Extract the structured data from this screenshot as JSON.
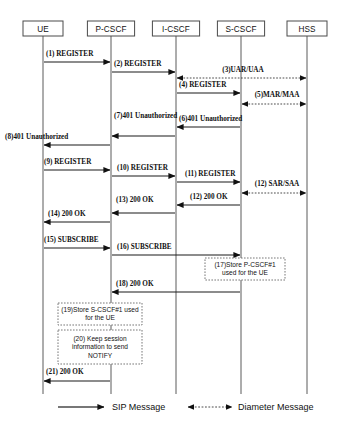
{
  "diagram": {
    "type": "sequence-diagram",
    "actors": [
      {
        "id": "ue",
        "label": "UE",
        "x": 43
      },
      {
        "id": "pcscf",
        "label": "P-CSCF",
        "x": 111
      },
      {
        "id": "icscf",
        "label": "I-CSCF",
        "x": 176
      },
      {
        "id": "scscf",
        "label": "S-CSCF",
        "x": 241
      },
      {
        "id": "hss",
        "label": "HSS",
        "x": 307
      }
    ],
    "messages": [
      {
        "n": 1,
        "label": "(1) REGISTER",
        "from": "ue",
        "to": "pcscf",
        "kind": "sip",
        "dir": "right",
        "y": 62,
        "labelAnchor": "start",
        "labelX": 46,
        "labelY": 56
      },
      {
        "n": 2,
        "label": "(2) REGISTER",
        "from": "pcscf",
        "to": "icscf",
        "kind": "sip",
        "dir": "right",
        "y": 72,
        "labelAnchor": "start",
        "labelX": 114,
        "labelY": 66
      },
      {
        "n": 3,
        "label": "(3)UAR/UAA",
        "from": "icscf",
        "to": "hss",
        "kind": "diameter",
        "dir": "both",
        "y": 78,
        "labelAnchor": "middle",
        "labelX": 243,
        "labelY": 72
      },
      {
        "n": 4,
        "label": "(4) REGISTER",
        "from": "icscf",
        "to": "scscf",
        "kind": "sip",
        "dir": "right",
        "y": 93,
        "labelAnchor": "start",
        "labelX": 179,
        "labelY": 87
      },
      {
        "n": 5,
        "label": "(5)MAR/MAA",
        "from": "scscf",
        "to": "hss",
        "kind": "diameter",
        "dir": "both",
        "y": 104,
        "labelAnchor": "middle",
        "labelX": 277,
        "labelY": 97
      },
      {
        "n": 6,
        "label": "(6)401 Unauthorized",
        "from": "scscf",
        "to": "icscf",
        "kind": "sip",
        "dir": "left",
        "y": 127,
        "labelAnchor": "start",
        "labelX": 179,
        "labelY": 121
      },
      {
        "n": 7,
        "label": "(7)401 Unauthorized",
        "from": "icscf",
        "to": "pcscf",
        "kind": "sip",
        "dir": "left",
        "y": 136,
        "labelAnchor": "start",
        "labelX": 114,
        "labelY": 118
      },
      {
        "n": 8,
        "label": "(8)401 Unauthorized",
        "from": "pcscf",
        "to": "ue",
        "kind": "sip",
        "dir": "left",
        "y": 145,
        "labelAnchor": "start",
        "labelX": 5,
        "labelY": 139
      },
      {
        "n": 9,
        "label": "(9) REGISTER",
        "from": "ue",
        "to": "pcscf",
        "kind": "sip",
        "dir": "right",
        "y": 170,
        "labelAnchor": "start",
        "labelX": 44,
        "labelY": 164
      },
      {
        "n": 10,
        "label": "(10) REGISTER",
        "from": "pcscf",
        "to": "icscf",
        "kind": "sip",
        "dir": "right",
        "y": 176,
        "labelAnchor": "start",
        "labelX": 117,
        "labelY": 170
      },
      {
        "n": 11,
        "label": "(11) REGISTER",
        "from": "icscf",
        "to": "scscf",
        "kind": "sip",
        "dir": "right",
        "y": 182,
        "labelAnchor": "start",
        "labelX": 185,
        "labelY": 176
      },
      {
        "n": 12,
        "label": "(12) SAR/SAA",
        "from": "scscf",
        "to": "hss",
        "kind": "diameter",
        "dir": "both",
        "y": 193,
        "labelAnchor": "middle",
        "labelX": 277,
        "labelY": 186
      },
      {
        "n": 13,
        "label": "(12) 200 OK",
        "from": "scscf",
        "to": "icscf",
        "kind": "sip",
        "dir": "left",
        "y": 205,
        "labelAnchor": "start",
        "labelX": 190,
        "labelY": 199
      },
      {
        "n": 14,
        "label": "(13) 200 OK",
        "from": "icscf",
        "to": "pcscf",
        "kind": "sip",
        "dir": "left",
        "y": 213,
        "labelAnchor": "start",
        "labelX": 116,
        "labelY": 202
      },
      {
        "n": 15,
        "label": "(14) 200 OK",
        "from": "pcscf",
        "to": "ue",
        "kind": "sip",
        "dir": "left",
        "y": 222,
        "labelAnchor": "start",
        "labelX": 48,
        "labelY": 216
      },
      {
        "n": 16,
        "label": "(15) SUBSCRIBE",
        "from": "ue",
        "to": "pcscf",
        "kind": "sip",
        "dir": "right",
        "y": 248,
        "labelAnchor": "start",
        "labelX": 44,
        "labelY": 242
      },
      {
        "n": 17,
        "label": "(16) SUBSCRIBE",
        "from": "pcscf",
        "to": "scscf",
        "kind": "sip",
        "dir": "right",
        "y": 255,
        "labelAnchor": "start",
        "labelX": 117,
        "labelY": 249
      },
      {
        "n": 18,
        "label": "(18) 200 OK",
        "from": "scscf",
        "to": "pcscf",
        "kind": "sip",
        "dir": "left",
        "y": 292,
        "labelAnchor": "start",
        "labelX": 116,
        "labelY": 286
      },
      {
        "n": 19,
        "label": "(21) 200 OK",
        "from": "pcscf",
        "to": "ue",
        "kind": "sip",
        "dir": "left",
        "y": 381,
        "labelAnchor": "start",
        "labelX": 46,
        "labelY": 374
      }
    ],
    "notes": [
      {
        "id": "note17",
        "x": 205,
        "y": 258,
        "w": 80,
        "h": 22,
        "lines": [
          "(17)Store P-CSCF#1",
          "used for the UE"
        ]
      },
      {
        "id": "note19",
        "x": 58,
        "y": 303,
        "w": 84,
        "h": 22,
        "lines": [
          "(19)Store S-CSCF#1 used",
          "for the UE"
        ]
      },
      {
        "id": "note20",
        "x": 58,
        "y": 330,
        "w": 84,
        "h": 34,
        "lines": [
          "(20) Keep session",
          "information to send",
          "NOTIFY"
        ]
      }
    ],
    "legend": {
      "items": [
        {
          "id": "sip",
          "label": "SIP Message",
          "kind": "sip"
        },
        {
          "id": "diameter",
          "label": "Diameter Message",
          "kind": "diameter"
        }
      ]
    }
  }
}
